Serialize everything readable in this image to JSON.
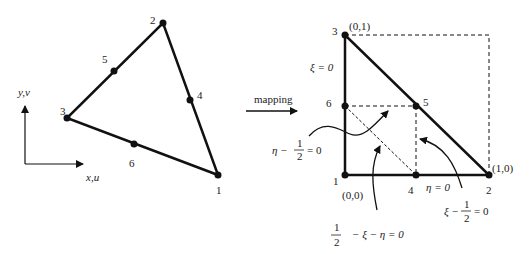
{
  "global_element": {
    "title": "Six-node triangular element",
    "nodes": [
      {
        "id": "1",
        "label": "1",
        "x": 218,
        "y": 175
      },
      {
        "id": "2",
        "label": "2",
        "x": 163,
        "y": 23
      },
      {
        "id": "3",
        "label": "3",
        "x": 67,
        "y": 118
      },
      {
        "id": "4",
        "label": "4",
        "x": 190,
        "y": 100
      },
      {
        "id": "5",
        "label": "5",
        "x": 114,
        "y": 71
      },
      {
        "id": "6",
        "label": "6",
        "x": 134,
        "y": 144
      }
    ],
    "axes": {
      "x_label": "x,u",
      "y_label": "y,v"
    }
  },
  "mapping": {
    "label": "mapping"
  },
  "natural_element": {
    "nodes": [
      {
        "id": "1",
        "label": "1",
        "coord": "(0,0)"
      },
      {
        "id": "2",
        "label": "2",
        "coord": "(1,0)"
      },
      {
        "id": "3",
        "label": "3",
        "coord": "(0,1)"
      },
      {
        "id": "4",
        "label": "4"
      },
      {
        "id": "5",
        "label": "5"
      },
      {
        "id": "6",
        "label": "6"
      }
    ],
    "equations": {
      "xi_zero": "ξ = 0",
      "eta_zero": "η = 0",
      "eta_half_lhs": "η −",
      "eta_half_num": "1",
      "eta_half_den": "2",
      "eta_half_rhs": "= 0",
      "xi_half_lhs": "ξ −",
      "xi_half_num": "1",
      "xi_half_den": "2",
      "xi_half_rhs": "= 0",
      "diag_num": "1",
      "diag_den": "2",
      "diag_rhs": "− ξ − η = 0"
    }
  }
}
